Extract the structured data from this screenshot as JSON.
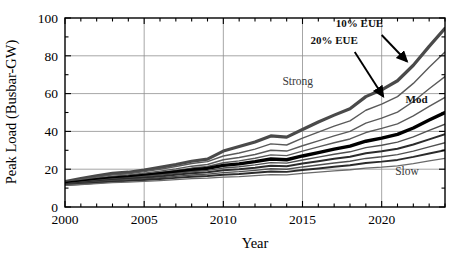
{
  "chart_data": {
    "type": "line",
    "title": "",
    "xlabel": "Year",
    "ylabel": "Peak Load (Busbar-GW)",
    "xlim": [
      2000,
      2024
    ],
    "ylim": [
      0,
      100
    ],
    "xticks": [
      2000,
      2005,
      2010,
      2015,
      2020
    ],
    "xtick_labels": [
      "2000",
      "2005",
      "2010",
      "2015",
      "2020"
    ],
    "yticks": [
      0,
      20,
      40,
      60,
      80,
      100
    ],
    "ytick_labels": [
      "0",
      "20",
      "40",
      "60",
      "80",
      "100"
    ],
    "minor_x_step": 1,
    "minor_y_step": 10,
    "grid": true,
    "grid_axis": "both",
    "legend": "none",
    "x": [
      2000,
      2001,
      2002,
      2003,
      2004,
      2005,
      2006,
      2007,
      2008,
      2009,
      2010,
      2011,
      2012,
      2013,
      2014,
      2015,
      2016,
      2017,
      2018,
      2019,
      2020,
      2021,
      2022,
      2023,
      2024
    ],
    "series": [
      {
        "name": "Strong 10% EUE",
        "emphasis": "heavy",
        "color": "#4a4a4a",
        "width": 3.2,
        "values": [
          13.4,
          15.0,
          16.5,
          17.8,
          18.4,
          19.6,
          21.0,
          22.5,
          24.2,
          25.3,
          29.6,
          32.0,
          34.4,
          37.6,
          37.0,
          41.0,
          45.0,
          48.6,
          52.0,
          58.4,
          62.0,
          66.8,
          75.0,
          85.0,
          94.5
        ]
      },
      {
        "name": "Strong 20% EUE",
        "emphasis": "light",
        "color": "#5a5a5a",
        "width": 1.4,
        "values": [
          13.0,
          14.4,
          15.8,
          17.0,
          17.6,
          18.7,
          20.0,
          21.4,
          23.0,
          24.0,
          27.0,
          28.6,
          30.6,
          33.4,
          32.8,
          36.4,
          39.6,
          42.8,
          45.6,
          51.2,
          54.4,
          58.4,
          65.4,
          74.0,
          82.0
        ]
      },
      {
        "name": "Mod high band",
        "emphasis": "light",
        "color": "#5a5a5a",
        "width": 1.4,
        "values": [
          12.8,
          14.0,
          15.2,
          16.3,
          16.9,
          17.9,
          19.0,
          20.2,
          21.6,
          22.5,
          25.0,
          26.2,
          27.8,
          30.0,
          29.6,
          32.4,
          35.0,
          37.6,
          40.0,
          44.4,
          47.0,
          50.2,
          55.8,
          62.6,
          69.0
        ]
      },
      {
        "name": "Mod upper",
        "emphasis": "light",
        "color": "#5a5a5a",
        "width": 1.4,
        "values": [
          12.6,
          13.7,
          14.8,
          15.8,
          16.4,
          17.3,
          18.3,
          19.4,
          20.6,
          21.4,
          23.4,
          24.4,
          25.8,
          27.6,
          27.2,
          29.6,
          31.8,
          34.0,
          36.0,
          39.4,
          41.6,
          44.0,
          48.2,
          53.2,
          58.0
        ]
      },
      {
        "name": "Mod 10% EUE",
        "emphasis": "heavy-black",
        "color": "#000000",
        "width": 3.4,
        "values": [
          12.4,
          13.4,
          14.4,
          15.3,
          15.9,
          16.7,
          17.6,
          18.6,
          19.6,
          20.4,
          22.0,
          22.8,
          24.0,
          25.4,
          25.0,
          27.0,
          28.8,
          30.6,
          32.2,
          34.8,
          36.4,
          38.4,
          41.8,
          46.0,
          50.0
        ]
      },
      {
        "name": "Mod 20% EUE",
        "emphasis": "light",
        "color": "#4f4f4f",
        "width": 1.4,
        "values": [
          12.2,
          13.1,
          14.0,
          14.8,
          15.4,
          16.1,
          16.9,
          17.8,
          18.7,
          19.4,
          20.6,
          21.3,
          22.3,
          23.5,
          23.2,
          24.9,
          26.4,
          27.9,
          29.2,
          31.4,
          32.7,
          34.3,
          37.1,
          40.5,
          43.8
        ]
      },
      {
        "name": "Slow upper",
        "emphasis": "medium",
        "color": "#2b2b2b",
        "width": 2.0,
        "values": [
          12.0,
          12.8,
          13.6,
          14.4,
          14.9,
          15.5,
          16.2,
          17.0,
          17.8,
          18.4,
          19.4,
          20.0,
          20.8,
          21.8,
          21.6,
          23.0,
          24.2,
          25.5,
          26.6,
          28.4,
          29.5,
          30.8,
          33.1,
          35.8,
          38.5
        ]
      },
      {
        "name": "Slow mid",
        "emphasis": "light",
        "color": "#4f4f4f",
        "width": 1.4,
        "values": [
          11.8,
          12.5,
          13.2,
          13.9,
          14.4,
          14.9,
          15.5,
          16.2,
          16.9,
          17.4,
          18.2,
          18.7,
          19.4,
          20.2,
          20.0,
          21.2,
          22.2,
          23.3,
          24.2,
          25.7,
          26.6,
          27.7,
          29.6,
          31.8,
          34.0
        ]
      },
      {
        "name": "Slow 10% EUE",
        "emphasis": "medium",
        "color": "#2b2b2b",
        "width": 1.9,
        "values": [
          11.6,
          12.2,
          12.8,
          13.4,
          13.8,
          14.3,
          14.8,
          15.4,
          16.0,
          16.4,
          17.1,
          17.5,
          18.1,
          18.8,
          18.6,
          19.6,
          20.4,
          21.3,
          22.1,
          23.3,
          24.0,
          24.9,
          26.5,
          28.3,
          30.0
        ]
      },
      {
        "name": "Slow 20% EUE",
        "emphasis": "light",
        "color": "#6a6a6a",
        "width": 1.3,
        "values": [
          11.4,
          11.9,
          12.4,
          12.9,
          13.2,
          13.6,
          14.0,
          14.5,
          15.0,
          15.3,
          15.8,
          16.1,
          16.6,
          17.1,
          17.0,
          17.8,
          18.4,
          19.1,
          19.7,
          20.6,
          21.1,
          21.8,
          23.0,
          24.4,
          25.7
        ]
      }
    ],
    "annotations": [
      {
        "id": "strong",
        "text": "Strong",
        "x": 2014.7,
        "y": 64.5,
        "style": "gray"
      },
      {
        "id": "mod",
        "text": "Mod",
        "x": 2022.2,
        "y": 55.0,
        "style": "dark"
      },
      {
        "id": "slow",
        "text": "Slow",
        "x": 2021.6,
        "y": 17.0,
        "style": "gray"
      },
      {
        "id": "eue10",
        "text": "10% EUE",
        "x": 2018.6,
        "y": 95.0,
        "style": "dark"
      },
      {
        "id": "eue20",
        "text": "20% EUE",
        "x": 2017.0,
        "y": 86.0,
        "style": "dark"
      }
    ],
    "arrows": [
      {
        "id": "arrow-10-eue",
        "x1": 2020.0,
        "y1": 91.0,
        "x2": 2021.6,
        "y2": 77.0
      },
      {
        "id": "arrow-20-eue",
        "x1": 2018.3,
        "y1": 82.0,
        "x2": 2020.1,
        "y2": 58.5
      }
    ]
  }
}
